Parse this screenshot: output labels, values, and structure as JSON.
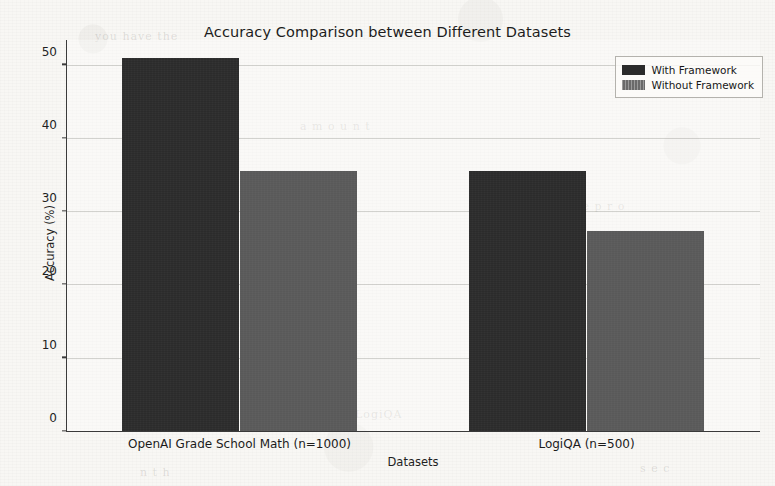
{
  "chart_data": {
    "type": "bar",
    "title": "Accuracy Comparison between Different Datasets",
    "xlabel": "Datasets",
    "ylabel": "Accuracy (%)",
    "categories": [
      "OpenAI Grade School Math (n=1000)",
      "LogiQA (n=500)"
    ],
    "series": [
      {
        "name": "With Framework",
        "values": [
          50.8,
          35.4
        ],
        "color": "#2b2b2b"
      },
      {
        "name": "Without Framework",
        "values": [
          35.4,
          27.2
        ],
        "color": "#595959"
      }
    ],
    "ylim": [
      0,
      53.5
    ],
    "yticks": [
      0,
      10,
      20,
      30,
      40,
      50
    ],
    "ytick_labels": [
      "0",
      "10",
      "20",
      "30",
      "40",
      "50"
    ],
    "grid": true,
    "grid_axis": "y",
    "legend_position": "upper right",
    "bar_width": 1.0
  },
  "legend": {
    "entries": [
      {
        "label": "With Framework",
        "swatch": "dark-gray-swatch"
      },
      {
        "label": "Without Framework",
        "swatch": "medium-gray-swatch"
      }
    ]
  },
  "background_artifacts": [
    "you have the",
    "a m o u n t",
    "t h e   p r o",
    "LogiQA",
    "n t h",
    "s e c"
  ]
}
